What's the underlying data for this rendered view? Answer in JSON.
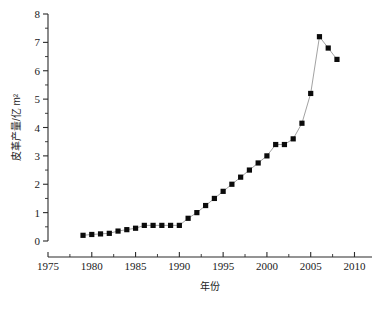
{
  "chart_data": {
    "type": "line",
    "title": "",
    "subtitle": "",
    "xlabel": "年份",
    "ylabel": "皮革产量/亿 m²",
    "xlim": [
      1975,
      2012
    ],
    "ylim": [
      0,
      8
    ],
    "xticks": [
      1975,
      1980,
      1985,
      1990,
      1995,
      2000,
      2005,
      2010
    ],
    "xtick_labels": [
      "1975",
      "1980",
      "1985",
      "1990",
      "1995",
      "2000",
      "2005",
      "2010"
    ],
    "x_minor_step": 2.5,
    "yticks": [
      0,
      1,
      2,
      3,
      4,
      5,
      6,
      7,
      8
    ],
    "ytick_labels": [
      "0",
      "1",
      "2",
      "3",
      "4",
      "5",
      "6",
      "7",
      "8"
    ],
    "y_minor_step": 0.5,
    "grid": false,
    "legend": false,
    "legend_position": "none",
    "marker": "square",
    "marker_color": "#0b0b0b",
    "line_color": "#8a8a8a",
    "background": "#ffffff",
    "axis_style": "open-left-bottom",
    "x": [
      1979,
      1980,
      1981,
      1982,
      1983,
      1984,
      1985,
      1986,
      1987,
      1988,
      1989,
      1990,
      1991,
      1992,
      1993,
      1994,
      1995,
      1996,
      1997,
      1998,
      1999,
      2000,
      2001,
      2002,
      2003,
      2004,
      2005,
      2006,
      2007,
      2008
    ],
    "values": [
      0.2,
      0.23,
      0.25,
      0.27,
      0.35,
      0.4,
      0.45,
      0.55,
      0.55,
      0.55,
      0.55,
      0.55,
      0.8,
      1.0,
      1.25,
      1.5,
      1.75,
      2.0,
      2.25,
      2.5,
      2.75,
      3.0,
      3.4,
      3.4,
      3.6,
      4.15,
      5.2,
      7.2,
      6.8,
      6.4
    ],
    "series": [
      {
        "name": "皮革产量",
        "x": [
          1979,
          1980,
          1981,
          1982,
          1983,
          1984,
          1985,
          1986,
          1987,
          1988,
          1989,
          1990,
          1991,
          1992,
          1993,
          1994,
          1995,
          1996,
          1997,
          1998,
          1999,
          2000,
          2001,
          2002,
          2003,
          2004,
          2005,
          2006,
          2007,
          2008
        ],
        "values": [
          0.2,
          0.23,
          0.25,
          0.27,
          0.35,
          0.4,
          0.45,
          0.55,
          0.55,
          0.55,
          0.55,
          0.55,
          0.8,
          1.0,
          1.25,
          1.5,
          1.75,
          2.0,
          2.25,
          2.5,
          2.75,
          3.0,
          3.4,
          3.4,
          3.6,
          4.15,
          5.2,
          7.2,
          6.8,
          6.4
        ]
      }
    ],
    "annotations": []
  }
}
